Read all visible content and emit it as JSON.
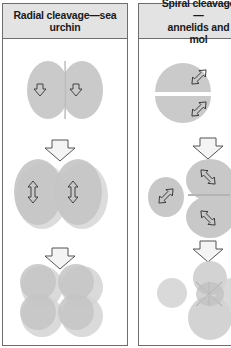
{
  "panels": [
    {
      "id": "radial",
      "title": "Radial cleavage—sea urchin",
      "stages": [
        {
          "label": "2-cell",
          "cells": 2,
          "arrow_icon": "down-arrow-icon"
        },
        {
          "label": "4-cell",
          "cells": 2,
          "arrow_icon": "double-arrow-vertical-icon"
        },
        {
          "label": "8-cell",
          "cells": 4
        }
      ]
    },
    {
      "id": "spiral",
      "title": "Spiral cleavage—\nannelids and mol",
      "stages": [
        {
          "label": "2-cell",
          "cells": 2,
          "arrow_icon": "double-arrow-diagonal-icon"
        },
        {
          "label": "4-cell",
          "cells": 4,
          "arrow_icon": "double-arrow-diagonal-icon"
        },
        {
          "label": "8-cell",
          "cells": 8
        }
      ]
    }
  ],
  "colors": {
    "header_bg": "#e3e3e3",
    "border": "#6e6e6e",
    "cell_fill": "#c8c8c8",
    "cell_fill_light": "#d6d6d6",
    "arrow_fill": "#f4f4f4",
    "arrow_stroke": "#555555"
  }
}
